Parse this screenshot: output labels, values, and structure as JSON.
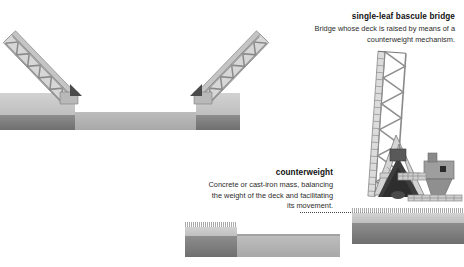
{
  "page": {
    "background": "#ffffff",
    "width": 464,
    "height": 267
  },
  "palette": {
    "truss_fill": "#d9d9d9",
    "truss_stroke": "#7a7a7a",
    "bank_light": "#cfcfcf",
    "bank_dark": "#7c7c7c",
    "water": "#b4b4b4",
    "counterweight_dark": "#3a3a3a",
    "text": "#1a1a1a",
    "leader": "#444444"
  },
  "title_callout": {
    "title": "single-leaf bascule bridge",
    "lines": [
      "Bridge whose deck is raised by means of a",
      "counterweight mechanism."
    ]
  },
  "counterweight_callout": {
    "title": "counterweight",
    "lines": [
      "Concrete or cast-iron mass, balancing",
      "the weight of the deck and facilitating",
      "its movement."
    ]
  },
  "figures": {
    "double_leaf": {
      "name": "double-leaf bascule bridge, both leaves raised",
      "left_leaf_angle_deg": -42,
      "right_leaf_angle_deg": 42,
      "truss_type": "warren-zigzag"
    },
    "single_leaf": {
      "name": "single-leaf bascule bridge, deck raised vertical",
      "leaf_angle_deg": 82,
      "truss_type": "warren-zigzag",
      "parts": [
        "raised-deck-truss",
        "a-frame-tower",
        "counterweight-mass",
        "control-house",
        "pier",
        "railing"
      ]
    }
  }
}
